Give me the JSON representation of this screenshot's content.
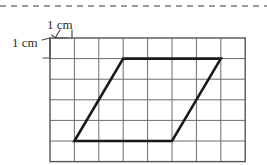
{
  "figure": {
    "type": "geometry-grid-diagram",
    "background_color": "#ffffff",
    "top_rule": {
      "style": "dashed",
      "color": "#9a9a9a",
      "y": 6,
      "x_start": 0,
      "x_end": 267,
      "dash": "6 5",
      "width": 2
    },
    "grid": {
      "columns": 8,
      "rows": 6,
      "origin_x": 50,
      "origin_y": 38,
      "cell_width": 24.4,
      "cell_height": 20.6,
      "line_color": "#6b6b6b",
      "line_width": 1,
      "border_color": "#555555",
      "border_width": 1.4,
      "cell_size_label": "1 cm"
    },
    "labels": {
      "horizontal": {
        "text": "1 cm",
        "meaning": "width of one grid cell"
      },
      "vertical": {
        "text": "1 cm",
        "meaning": "height of one grid cell"
      }
    },
    "dimension_marks": {
      "color": "#4a4a4a",
      "width": 1.2,
      "horizontal_leader": "from label down to top edge of first cell",
      "vertical_leader": "from label right to left edge of first cell"
    },
    "shape": {
      "name": "parallelogram",
      "stroke_color": "#1a1a1a",
      "stroke_width": 2.6,
      "fill": "none",
      "vertices_grid": [
        {
          "name": "top-left",
          "col": 3,
          "row": 1
        },
        {
          "name": "top-right",
          "col": 7,
          "row": 1
        },
        {
          "name": "bottom-right",
          "col": 5,
          "row": 5
        },
        {
          "name": "bottom-left",
          "col": 1,
          "row": 5
        }
      ],
      "base_cells": 4,
      "height_cells": 4,
      "slant_offset_cells": 2
    }
  }
}
